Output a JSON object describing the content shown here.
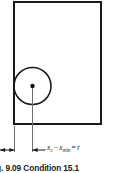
{
  "figure": {
    "caption": "g. 9.09  Condition 15.1",
    "dimension_label": {
      "var1": "x",
      "var1_sub": "c",
      "operator": "−",
      "var2": "x",
      "var2_sub": "min",
      "equals": "=",
      "result": "r",
      "full_text": "x_c − x_min = r"
    },
    "colors": {
      "stroke": "#1a1a1a",
      "thin_stroke": "#555555",
      "background": "#ffffff",
      "text": "#1b1b1b"
    },
    "geometry": {
      "rect": {
        "x": 14,
        "y": 2,
        "width": 87,
        "height": 122
      },
      "circle": {
        "cx": 32.5,
        "cy": 86,
        "r": 18.5
      },
      "center_dot": {
        "cx": 32.5,
        "cy": 86,
        "r": 2.1
      },
      "center_leader": {
        "x": 32.5,
        "y1": 86,
        "y2": 152
      },
      "extension_line_left": {
        "x": 14.5,
        "y1": 126,
        "y2": 152
      },
      "dimension_line_y": 150,
      "arrow_left_tip_x": 1,
      "arrow_right_tip_x": 14,
      "arrow_label_tip_x": 32.5
    }
  }
}
